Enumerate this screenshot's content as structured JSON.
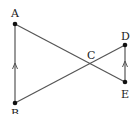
{
  "diagram": {
    "type": "geometry",
    "points": {
      "A": {
        "label": "A",
        "x": 15,
        "y": 24
      },
      "B": {
        "label": "B",
        "x": 15,
        "y": 103
      },
      "C": {
        "label": "C",
        "x": 90,
        "y": 64
      },
      "D": {
        "label": "D",
        "x": 125,
        "y": 45
      },
      "E": {
        "label": "E",
        "x": 125,
        "y": 82
      }
    },
    "segments": [
      "AB",
      "AE",
      "BD",
      "DE"
    ],
    "parallel_marks": [
      "AB",
      "ED"
    ],
    "colors": {
      "line": "#555555",
      "point": "#111111"
    }
  }
}
